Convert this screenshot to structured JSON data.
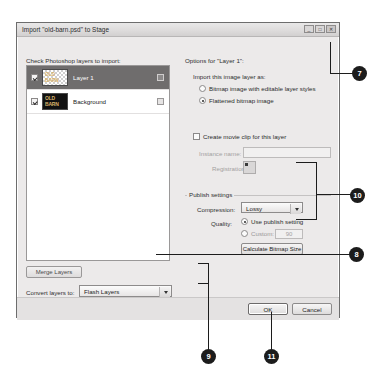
{
  "dialog": {
    "title": "Import \"old-barn.psd\" to Stage",
    "window_buttons": {
      "minimize": "_",
      "maximize": "□",
      "close": "✕"
    }
  },
  "left_panel": {
    "heading": "Check Photoshop layers to import:",
    "layers": [
      {
        "name": "Layer 1",
        "checked": true,
        "selected": true,
        "thumb_line1": "OLD",
        "thumb_line2": "BARN"
      },
      {
        "name": "Background",
        "checked": true,
        "selected": false,
        "thumb_line1": "OLD",
        "thumb_line2": "BARN"
      }
    ],
    "merge_button": "Merge Layers",
    "convert_label": "Convert layers to:",
    "convert_value": "Flash Layers",
    "convert_options": [
      "Flash Layers",
      "Keyframes",
      "Single Flash Layer"
    ],
    "checkboxes": [
      {
        "label": "Place layers at original position",
        "checked": true
      },
      {
        "label": "Set stage size to same size as Photoshop canvas (1024 x 681)",
        "checked": false
      }
    ]
  },
  "right_panel": {
    "options_heading": "Options for \"Layer 1\":",
    "import_as_label": "Import this image layer as:",
    "import_as_options": [
      {
        "label": "Bitmap image with editable layer styles",
        "selected": false
      },
      {
        "label": "Flattened bitmap image",
        "selected": true
      }
    ],
    "movieclip": {
      "label": "Create movie clip for this layer",
      "checked": false
    },
    "instance_name_label": "Instance name:",
    "instance_name_value": "",
    "registration_label": "Registration:",
    "publish": {
      "group_title": "Publish settings",
      "compression_label": "Compression:",
      "compression_value": "Lossy",
      "compression_options": [
        "Lossy",
        "Lossless"
      ],
      "quality_label": "Quality:",
      "quality_options": [
        {
          "label": "Use publish setting",
          "selected": true
        },
        {
          "label": "Custom:",
          "selected": false
        }
      ],
      "custom_value": "90",
      "calculate_button": "Calculate Bitmap Size"
    }
  },
  "footer": {
    "ok": "OK",
    "cancel": "Cancel"
  },
  "callouts": [
    {
      "number": "7"
    },
    {
      "number": "10"
    },
    {
      "number": "8"
    },
    {
      "number": "9"
    },
    {
      "number": "11"
    }
  ],
  "colors": {
    "callout_bg": "#1c1c1c",
    "dialog_bg": "#eceaea",
    "selection": "#6f6d6d"
  }
}
